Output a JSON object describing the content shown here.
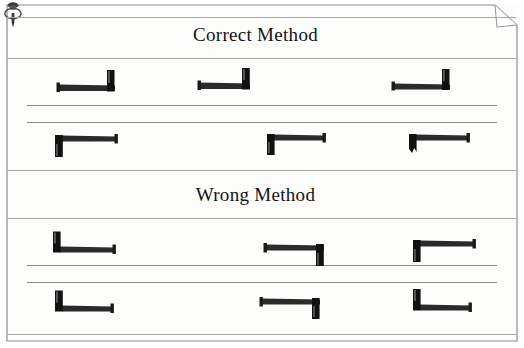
{
  "document": {
    "type": "scanned-diagram",
    "page_background": "#fdfdfc",
    "ink_color": "#141414",
    "rule_color": "#6e6e6e",
    "folded_corner": true,
    "tack_icon": "thumbtack-icon"
  },
  "sections": [
    {
      "id": "correct",
      "title": "Correct Method",
      "rows": [
        {
          "id": "correct-row-1",
          "surface_rule": true,
          "nails": [
            {
              "id": "correct-1-a",
              "head_side": "right",
              "head_direction": "up",
              "x": 55,
              "y": 68
            },
            {
              "id": "correct-1-b",
              "head_side": "right",
              "head_direction": "up",
              "x": 196,
              "y": 66
            },
            {
              "id": "correct-1-c",
              "head_side": "right",
              "head_direction": "up",
              "x": 390,
              "y": 67
            }
          ]
        },
        {
          "id": "correct-row-2",
          "surface_rule": true,
          "nails": [
            {
              "id": "correct-2-a",
              "head_side": "left",
              "head_direction": "down",
              "x": 50,
              "y": 131
            },
            {
              "id": "correct-2-b",
              "head_side": "left",
              "head_direction": "down",
              "x": 262,
              "y": 130
            },
            {
              "id": "correct-2-c",
              "head_side": "left",
              "head_direction": "down",
              "x": 404,
              "y": 130
            }
          ]
        }
      ]
    },
    {
      "id": "wrong",
      "title": "Wrong Method",
      "rows": [
        {
          "id": "wrong-row-1",
          "surface_rule": true,
          "nails": [
            {
              "id": "wrong-1-a",
              "head_side": "left",
              "head_direction": "up",
              "x": 48,
              "y": 230
            },
            {
              "id": "wrong-1-b",
              "head_side": "right",
              "head_direction": "down",
              "x": 262,
              "y": 240
            },
            {
              "id": "wrong-1-c",
              "head_side": "left",
              "head_direction": "down",
              "x": 408,
              "y": 236
            }
          ]
        },
        {
          "id": "wrong-row-2",
          "surface_rule": true,
          "nails": [
            {
              "id": "wrong-2-a",
              "head_side": "left",
              "head_direction": "up",
              "x": 50,
              "y": 289
            },
            {
              "id": "wrong-2-b",
              "head_side": "right",
              "head_direction": "down",
              "x": 258,
              "y": 294
            },
            {
              "id": "wrong-2-c",
              "head_side": "left",
              "head_direction": "up",
              "x": 408,
              "y": 288
            }
          ]
        }
      ]
    }
  ],
  "rules": [
    {
      "id": "rule-top",
      "x": 7,
      "y": 17,
      "w": 509,
      "weight": "light"
    },
    {
      "id": "rule-under-correct",
      "x": 7,
      "y": 58,
      "w": 509,
      "weight": "light"
    },
    {
      "id": "rule-correct-surf-1",
      "x": 27,
      "y": 105,
      "w": 470,
      "weight": "normal"
    },
    {
      "id": "rule-correct-surf-2",
      "x": 27,
      "y": 122,
      "w": 470,
      "weight": "normal"
    },
    {
      "id": "rule-under-row2",
      "x": 7,
      "y": 170,
      "w": 509,
      "weight": "light"
    },
    {
      "id": "rule-under-wrong",
      "x": 7,
      "y": 218,
      "w": 509,
      "weight": "light"
    },
    {
      "id": "rule-wrong-surf-1",
      "x": 27,
      "y": 265,
      "w": 470,
      "weight": "normal"
    },
    {
      "id": "rule-wrong-surf-2",
      "x": 27,
      "y": 282,
      "w": 470,
      "weight": "normal"
    },
    {
      "id": "rule-bottom",
      "x": 7,
      "y": 334,
      "w": 509,
      "weight": "light"
    }
  ]
}
